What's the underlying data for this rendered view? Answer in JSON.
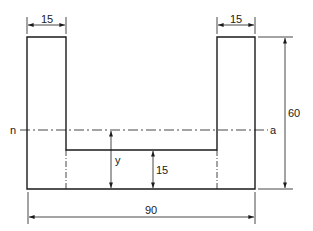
{
  "diagram": {
    "labels": {
      "flange_left_width": "15",
      "flange_right_width": "15",
      "total_height": "60",
      "total_width": "90",
      "web_thickness": "15",
      "centroid_distance": "y",
      "neutral_axis_left": "n",
      "neutral_axis_right": "a"
    },
    "colors": {
      "line": "#1a1a1a",
      "background": "#ffffff"
    }
  }
}
